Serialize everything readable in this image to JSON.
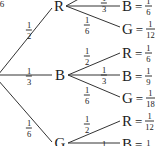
{
  "diagram": {
    "type": "probability-tree",
    "root_mark": "6",
    "first_level": [
      {
        "label": "R",
        "prob": {
          "num": "1",
          "den": "2"
        }
      },
      {
        "label": "B",
        "prob": {
          "num": "1",
          "den": "3"
        }
      },
      {
        "label": "G",
        "prob": {
          "num": "1",
          "den": "6"
        }
      }
    ],
    "second_level": [
      {
        "parent": "R",
        "branches": [
          {
            "label": "B",
            "prob": {
              "num": "1",
              "den": "3"
            },
            "outcome": {
              "num": "1",
              "den": "6"
            }
          },
          {
            "label": "G",
            "prob": {
              "num": "1",
              "den": "6"
            },
            "outcome": {
              "num": "1",
              "den": "12"
            }
          }
        ]
      },
      {
        "parent": "B",
        "branches": [
          {
            "label": "R",
            "prob": {
              "num": "1",
              "den": "2"
            },
            "outcome": {
              "num": "1",
              "den": "6"
            }
          },
          {
            "label": "B",
            "prob": {
              "num": "1",
              "den": "3"
            },
            "outcome": {
              "num": "1",
              "den": "9"
            }
          },
          {
            "label": "G",
            "prob": {
              "num": "1",
              "den": "6"
            },
            "outcome": {
              "num": "1",
              "den": "18"
            }
          }
        ]
      },
      {
        "parent": "G",
        "branches": [
          {
            "label": "R",
            "prob": {
              "num": "1",
              "den": "2"
            },
            "outcome": {
              "num": "1",
              "den": "12"
            }
          },
          {
            "label": "B",
            "prob": {
              "num": "1",
              "den": ""
            },
            "outcome": {
              "num": "1",
              "den": ""
            }
          }
        ]
      }
    ],
    "equals": "="
  }
}
